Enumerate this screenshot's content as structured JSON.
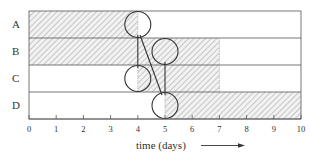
{
  "diagram": {
    "rows": [
      {
        "label": "A",
        "hatched": [
          0,
          4
        ],
        "marker": 4
      },
      {
        "label": "B",
        "hatched": [
          0,
          7
        ],
        "marker": 5
      },
      {
        "label": "C",
        "hatched": [
          4,
          7
        ],
        "marker": 4
      },
      {
        "label": "D",
        "hatched": [
          5,
          10
        ],
        "marker": 5
      }
    ],
    "x_ticks": [
      "0",
      "1",
      "2",
      "3",
      "4",
      "5",
      "6",
      "7",
      "8",
      "9",
      "10"
    ],
    "x_axis_label": "time (days)",
    "x_range": [
      0,
      10
    ],
    "connectors": [
      {
        "from": "A",
        "to": "C",
        "type": "vertical",
        "at": 4
      },
      {
        "from": "A",
        "to": "D",
        "type": "diagonal",
        "from_at": 4,
        "to_at": 5
      },
      {
        "from": "B",
        "to": "D",
        "type": "vertical",
        "at": 5
      }
    ],
    "colors": {
      "line": "#333333",
      "hatch": "#9a9a9a",
      "text": "#333333"
    }
  }
}
